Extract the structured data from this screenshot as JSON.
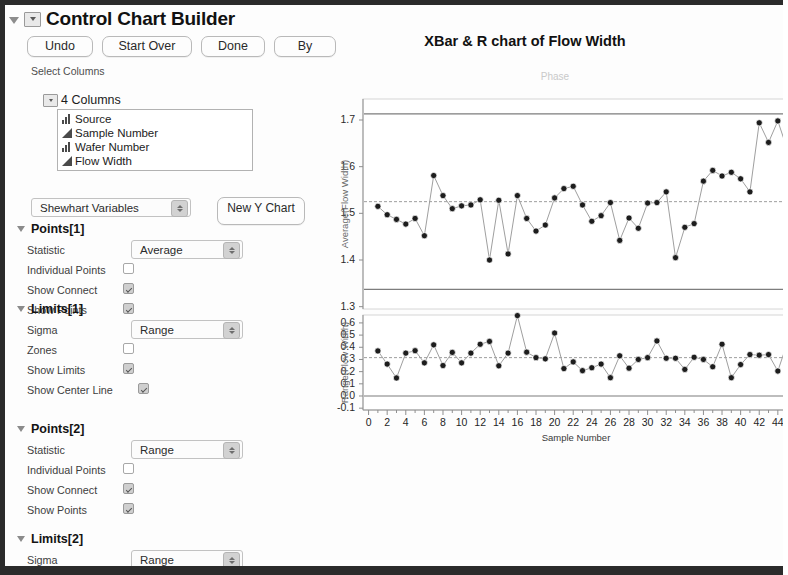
{
  "window": {
    "title": "Control Chart Builder",
    "disclosure_icon": "triangle-down-icon",
    "popup_icon": "popup-menu-icon"
  },
  "toolbar": {
    "buttons": [
      {
        "label": "Undo",
        "name": "undo-button"
      },
      {
        "label": "Start Over",
        "name": "start-over-button"
      },
      {
        "label": "Done",
        "name": "done-button"
      },
      {
        "label": "By",
        "name": "by-button"
      }
    ]
  },
  "select_columns": {
    "label": "Select Columns",
    "group_label": "4 Columns",
    "items": [
      {
        "name": "Source",
        "icon": "nominal-bars-icon"
      },
      {
        "name": "Sample Number",
        "icon": "continuous-triangle-icon"
      },
      {
        "name": "Wafer Number",
        "icon": "nominal-bars-icon"
      },
      {
        "name": "Flow Width",
        "icon": "continuous-triangle-icon"
      }
    ]
  },
  "chart_type": {
    "selected": "Shewhart Variables",
    "new_y_chart_label": "New Y Chart"
  },
  "sections": [
    {
      "name": "Points[1]",
      "rows": [
        {
          "label": "Statistic",
          "type": "combo",
          "value": "Average"
        },
        {
          "label": "Individual Points",
          "type": "checkbox",
          "checked": false
        },
        {
          "label": "Show Connect",
          "type": "checkbox",
          "checked": true
        },
        {
          "label": "Show Points",
          "type": "checkbox",
          "checked": true
        }
      ]
    },
    {
      "name": "Limits[1]",
      "rows": [
        {
          "label": "Sigma",
          "type": "combo",
          "value": "Range"
        },
        {
          "label": "Zones",
          "type": "checkbox",
          "checked": false
        },
        {
          "label": "Show Limits",
          "type": "checkbox",
          "checked": true
        },
        {
          "label": "Show Center Line",
          "type": "checkbox",
          "checked": true
        }
      ]
    },
    {
      "name": "Points[2]",
      "rows": [
        {
          "label": "Statistic",
          "type": "combo",
          "value": "Range"
        },
        {
          "label": "Individual Points",
          "type": "checkbox",
          "checked": false
        },
        {
          "label": "Show Connect",
          "type": "checkbox",
          "checked": true
        },
        {
          "label": "Show Points",
          "type": "checkbox",
          "checked": true
        }
      ]
    },
    {
      "name": "Limits[2]",
      "rows": [
        {
          "label": "Sigma",
          "type": "combo",
          "value": "Range"
        }
      ]
    }
  ],
  "chart_data": [
    {
      "type": "line",
      "id": "xbar-chart",
      "title": "XBar & R chart of Flow Width",
      "phase_label": "Phase",
      "xlabel": "Sample Number",
      "ylabel": "Average(Flow Width)",
      "ylim": [
        1.295,
        1.745
      ],
      "yticks": [
        1.7,
        1.6,
        1.5,
        1.4,
        1.3
      ],
      "xlim": [
        -0.6,
        45.2
      ],
      "xticks": [
        0,
        2,
        4,
        6,
        8,
        10,
        12,
        14,
        16,
        18,
        20,
        22,
        24,
        26,
        28,
        30,
        32,
        34,
        36,
        38,
        40,
        42,
        44
      ],
      "grid": false,
      "legend": "none",
      "control_limits": {
        "ucl": 1.713,
        "center": 1.525,
        "lcl": 1.337
      },
      "x": [
        1,
        2,
        3,
        4,
        5,
        6,
        7,
        8,
        9,
        10,
        11,
        12,
        13,
        14,
        15,
        16,
        17,
        18,
        19,
        20,
        21,
        22,
        23,
        24,
        25,
        26,
        27,
        28,
        29,
        30,
        31,
        32,
        33,
        34,
        35,
        36,
        37,
        38,
        39,
        40,
        41,
        42,
        43,
        44,
        45
      ],
      "values": [
        1.515,
        1.497,
        1.487,
        1.477,
        1.489,
        1.452,
        1.581,
        1.538,
        1.51,
        1.516,
        1.518,
        1.529,
        1.4,
        1.528,
        1.413,
        1.538,
        1.489,
        1.462,
        1.475,
        1.533,
        1.553,
        1.558,
        1.518,
        1.483,
        1.495,
        1.523,
        1.442,
        1.49,
        1.468,
        1.522,
        1.523,
        1.546,
        1.405,
        1.47,
        1.478,
        1.569,
        1.592,
        1.58,
        1.588,
        1.574,
        1.546,
        1.694,
        1.652,
        1.698,
        1.638
      ]
    },
    {
      "type": "line",
      "id": "range-chart",
      "xlabel": "Sample Number",
      "ylabel": "Range(Flow Width)",
      "ylim": [
        -0.115,
        0.665
      ],
      "yticks": [
        0.6,
        0.5,
        0.4,
        0.3,
        0.2,
        0.1,
        0.0,
        -0.1
      ],
      "xlim": [
        -0.6,
        45.2
      ],
      "xticks": [
        0,
        2,
        4,
        6,
        8,
        10,
        12,
        14,
        16,
        18,
        20,
        22,
        24,
        26,
        28,
        30,
        32,
        34,
        36,
        38,
        40,
        42,
        44
      ],
      "grid": false,
      "legend": "none",
      "control_limits": {
        "ucl": 0.666,
        "center": 0.315,
        "lcl": 0.0
      },
      "x": [
        1,
        2,
        3,
        4,
        5,
        6,
        7,
        8,
        9,
        10,
        11,
        12,
        13,
        14,
        15,
        16,
        17,
        18,
        19,
        20,
        21,
        22,
        23,
        24,
        25,
        26,
        27,
        28,
        29,
        30,
        31,
        32,
        33,
        34,
        35,
        36,
        37,
        38,
        39,
        40,
        41,
        42,
        43,
        44,
        45
      ],
      "values": [
        0.37,
        0.262,
        0.148,
        0.352,
        0.372,
        0.272,
        0.42,
        0.25,
        0.358,
        0.272,
        0.352,
        0.425,
        0.448,
        0.248,
        0.352,
        0.66,
        0.36,
        0.315,
        0.305,
        0.517,
        0.225,
        0.28,
        0.208,
        0.232,
        0.262,
        0.15,
        0.33,
        0.228,
        0.3,
        0.315,
        0.452,
        0.31,
        0.31,
        0.218,
        0.318,
        0.3,
        0.24,
        0.425,
        0.15,
        0.258,
        0.34,
        0.335,
        0.34,
        0.205,
        0.432
      ]
    }
  ]
}
